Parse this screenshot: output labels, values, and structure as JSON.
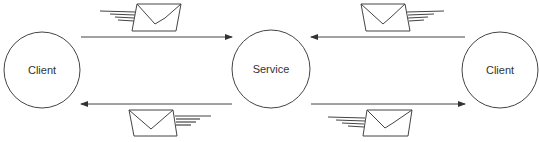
{
  "diagram": {
    "nodes": [
      {
        "id": "client-left",
        "label": "Client",
        "cx": 42,
        "cy": 70,
        "r": 38
      },
      {
        "id": "service",
        "label": "Service",
        "cx": 271,
        "cy": 69,
        "r": 39
      },
      {
        "id": "client-right",
        "label": "Client",
        "cx": 500,
        "cy": 70,
        "r": 38
      }
    ],
    "edges": [
      {
        "from": "client-left",
        "to": "service",
        "direction": "right",
        "y": 37,
        "message": "envelope-icon"
      },
      {
        "from": "service",
        "to": "client-left",
        "direction": "left",
        "y": 104,
        "message": "envelope-icon"
      },
      {
        "from": "client-right",
        "to": "service",
        "direction": "left",
        "y": 37,
        "message": "envelope-icon"
      },
      {
        "from": "service",
        "to": "client-right",
        "direction": "right",
        "y": 104,
        "message": "envelope-icon"
      }
    ],
    "colors": {
      "stroke": "#333333",
      "background": "#ffffff"
    }
  }
}
